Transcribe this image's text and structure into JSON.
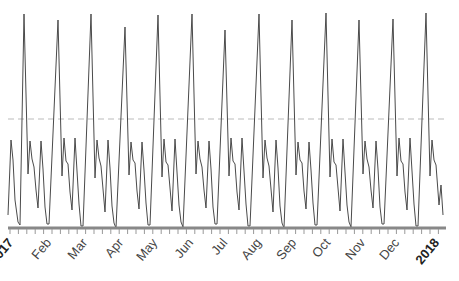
{
  "chart_data": {
    "type": "line",
    "title": "",
    "xlabel": "",
    "ylabel": "",
    "x_range": [
      "2017-01-01",
      "2018-01-01"
    ],
    "tick_labels": [
      "2017",
      "Feb",
      "Mar",
      "Apr",
      "May",
      "Jun",
      "Jul",
      "Aug",
      "Sep",
      "Oct",
      "Nov",
      "Dec",
      "2018"
    ],
    "reference_line": {
      "style": "dashed",
      "color": "#bbbbbb",
      "y_px": 119
    },
    "grid": false,
    "legend": null,
    "series": [
      {
        "name": "daily value",
        "color": "#555555",
        "peak_positions_px": [
          24,
          58,
          91,
          125,
          158,
          192,
          225,
          259,
          292,
          326,
          359,
          393,
          426
        ],
        "peak_heights_px": [
          14,
          20,
          14,
          27,
          15,
          14,
          30,
          14,
          20,
          13,
          20,
          19,
          13
        ]
      }
    ]
  },
  "axis": {
    "labels": [
      {
        "text": "2017",
        "x": 14,
        "year": true
      },
      {
        "text": "Feb",
        "x": 52
      },
      {
        "text": "Mar",
        "x": 88
      },
      {
        "text": "Apr",
        "x": 124
      },
      {
        "text": "May",
        "x": 158
      },
      {
        "text": "Jun",
        "x": 194
      },
      {
        "text": "Jul",
        "x": 228
      },
      {
        "text": "Aug",
        "x": 262
      },
      {
        "text": "Sep",
        "x": 297
      },
      {
        "text": "Oct",
        "x": 331
      },
      {
        "text": "Nov",
        "x": 366
      },
      {
        "text": "Dec",
        "x": 400
      },
      {
        "text": "2018",
        "x": 440,
        "year": true
      }
    ]
  }
}
